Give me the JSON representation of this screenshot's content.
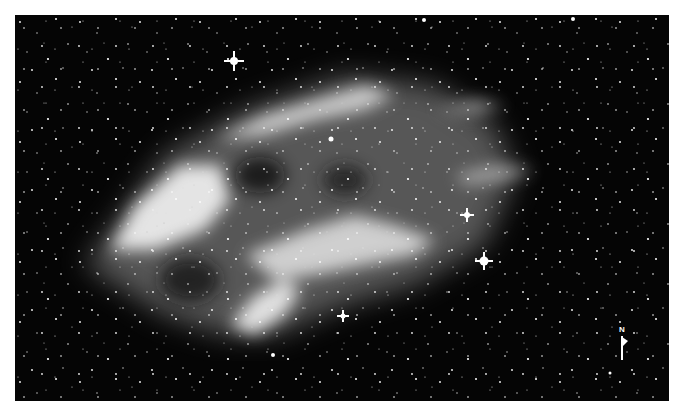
{
  "image": {
    "subject": "nebula-star-field",
    "colors": {
      "background": "#ffffff",
      "sky": "#050505",
      "nebula": "#e6e6e6",
      "stars": "#ffffff"
    }
  },
  "compass": {
    "label": "N"
  }
}
